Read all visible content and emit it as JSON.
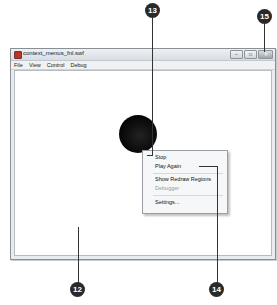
{
  "window": {
    "title": "context_menus_fnl.swf",
    "controls": {
      "minimize": "–",
      "maximize": "□",
      "close": "✕"
    },
    "menu": [
      "File",
      "View",
      "Control",
      "Debug"
    ]
  },
  "context_menu": {
    "items": [
      {
        "label": "Stop",
        "enabled": true
      },
      {
        "label": "Play Again",
        "enabled": true
      },
      {
        "label": "Show Redraw Regions",
        "enabled": true
      },
      {
        "label": "Debugger",
        "enabled": false
      },
      {
        "label": "Settings...",
        "enabled": true
      }
    ]
  },
  "callouts": [
    "12",
    "13",
    "14",
    "15"
  ]
}
